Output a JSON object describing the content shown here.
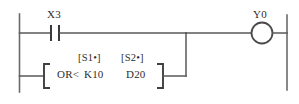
{
  "diagram": {
    "type": "plc-ladder-logic",
    "rungs": [
      {
        "name": "rung-1",
        "elements": [
          {
            "kind": "contact-normally-open",
            "label": "X3"
          },
          {
            "kind": "output-coil",
            "label": "Y0"
          }
        ]
      },
      {
        "name": "rung-2-branch",
        "elements": [
          {
            "kind": "compare-instruction-block",
            "instruction": "OR<",
            "operands": [
              {
                "header": "[S1•]",
                "value": "K10"
              },
              {
                "header": "[S2•]",
                "value": "D20"
              }
            ]
          }
        ]
      }
    ]
  },
  "labels": {
    "input_contact": "X3",
    "output_coil": "Y0",
    "instruction": "OR<",
    "operand1_header": "[S1•]",
    "operand1_value": "K10",
    "operand2_header": "[S2•]",
    "operand2_value": "D20"
  },
  "colors": {
    "background": "#ffffff",
    "wire": "#58585a",
    "rail": "#6b6b6d",
    "symbol": "#3a3a3c",
    "text": "#2e2e30"
  }
}
